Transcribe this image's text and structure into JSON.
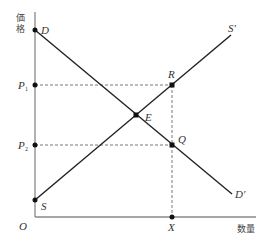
{
  "diagram": {
    "type": "supply-demand",
    "y_axis_label": "価格",
    "x_axis_label": "数量",
    "origin_label": "O",
    "colors": {
      "axis": "#888888",
      "line": "#222222",
      "dashed": "#555555",
      "point": "#111111"
    },
    "curves": [
      {
        "name": "demand",
        "start_label": "D",
        "end_label": "D′"
      },
      {
        "name": "supply",
        "start_label": "S",
        "end_label": "S′"
      }
    ],
    "points": {
      "equilibrium": "E",
      "upper": "R",
      "lower": "Q",
      "quantity": "X"
    },
    "price_levels": [
      {
        "label": "P",
        "sub": "1"
      },
      {
        "label": "P",
        "sub": "2"
      }
    ]
  }
}
